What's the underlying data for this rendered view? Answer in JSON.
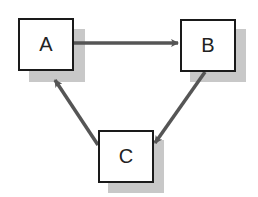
{
  "diagram": {
    "type": "cycle",
    "nodes": [
      {
        "id": "A",
        "label": "A"
      },
      {
        "id": "B",
        "label": "B"
      },
      {
        "id": "C",
        "label": "C"
      }
    ],
    "edges": [
      {
        "from": "A",
        "to": "B"
      },
      {
        "from": "B",
        "to": "C"
      },
      {
        "from": "C",
        "to": "A"
      }
    ],
    "colors": {
      "border": "#1a1a1a",
      "arrow": "#555555",
      "shadow": "#c8c8c8",
      "fill": "#ffffff"
    }
  }
}
